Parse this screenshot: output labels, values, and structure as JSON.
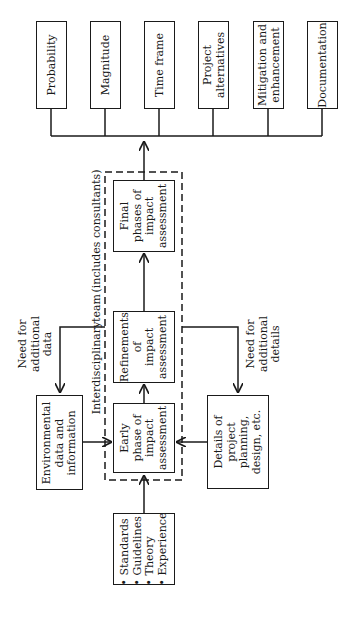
{
  "diagram": {
    "orientation": "rotated -90deg (reads bottom-to-top)",
    "outputs": [
      {
        "id": "probability",
        "lines": [
          "Probability"
        ]
      },
      {
        "id": "magnitude",
        "lines": [
          "Magnitude"
        ]
      },
      {
        "id": "time-frame",
        "lines": [
          "Time frame"
        ]
      },
      {
        "id": "project-alternatives",
        "lines": [
          "Project",
          "alternatives"
        ]
      },
      {
        "id": "mitigation",
        "lines": [
          "Mitigation and",
          "enhancement"
        ]
      },
      {
        "id": "documentation",
        "lines": [
          "Documentation"
        ]
      }
    ],
    "team": {
      "label": "Interdisciplinary team (includes consultants)",
      "label_part1": "Interdisciplinary",
      "label_part2": "team",
      "label_part3": "(includes consultants)"
    },
    "phases": {
      "final": [
        "Final",
        "phases of",
        "impact",
        "assessment"
      ],
      "refinements": [
        "Refinements",
        "of",
        "impact",
        "assessment"
      ],
      "early": [
        "Early",
        "phase of",
        "impact",
        "assessment"
      ]
    },
    "environmental": [
      "Environmental",
      "data and",
      "information"
    ],
    "details": [
      "Details of",
      "project",
      "planning,",
      "design, etc."
    ],
    "inputs": {
      "bullets": [
        "Standards",
        "Guidelines",
        "Theory",
        "Experience"
      ],
      "bullet_char": "•"
    },
    "feedback": {
      "data": [
        "Need for",
        "additional",
        "data"
      ],
      "details": [
        "Need for",
        "additional",
        "details"
      ]
    }
  }
}
